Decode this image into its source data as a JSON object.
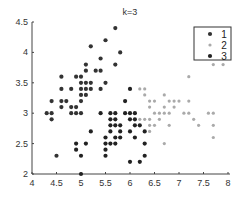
{
  "chart_data": {
    "type": "scatter",
    "title": "k=3",
    "xlabel": "",
    "ylabel": "",
    "xlim": [
      4,
      8
    ],
    "ylim": [
      2,
      4.5
    ],
    "xticks": [
      "4",
      "4.5",
      "5",
      "5.5",
      "6",
      "6.5",
      "7",
      "7.5",
      "8"
    ],
    "yticks": [
      "2",
      "2.5",
      "3",
      "3.5",
      "4",
      "4.5"
    ],
    "grid": false,
    "legend_position": "upper right",
    "series": [
      {
        "name": "1",
        "color": "#333333",
        "points": [
          [
            4.3,
            3.0
          ],
          [
            4.4,
            2.9
          ],
          [
            4.4,
            3.0
          ],
          [
            4.4,
            3.2
          ],
          [
            4.5,
            2.3
          ],
          [
            4.6,
            3.1
          ],
          [
            4.6,
            3.2
          ],
          [
            4.6,
            3.4
          ],
          [
            4.6,
            3.6
          ],
          [
            4.7,
            3.2
          ],
          [
            4.8,
            3.0
          ],
          [
            4.8,
            3.1
          ],
          [
            4.8,
            3.4
          ],
          [
            4.9,
            3.0
          ],
          [
            4.9,
            3.1
          ],
          [
            4.9,
            3.6
          ],
          [
            5.0,
            3.0
          ],
          [
            5.0,
            3.2
          ],
          [
            5.0,
            3.3
          ],
          [
            5.0,
            3.4
          ],
          [
            5.0,
            3.5
          ],
          [
            5.0,
            3.6
          ],
          [
            5.1,
            3.3
          ],
          [
            5.1,
            3.4
          ],
          [
            5.1,
            3.5
          ],
          [
            5.1,
            3.7
          ],
          [
            5.1,
            3.8
          ],
          [
            5.2,
            3.4
          ],
          [
            5.2,
            3.5
          ],
          [
            5.2,
            4.1
          ],
          [
            5.3,
            3.7
          ],
          [
            5.4,
            3.4
          ],
          [
            5.4,
            3.7
          ],
          [
            5.4,
            3.9
          ],
          [
            5.5,
            3.5
          ],
          [
            5.5,
            4.2
          ],
          [
            5.7,
            3.8
          ],
          [
            5.7,
            4.4
          ],
          [
            5.8,
            4.0
          ]
        ]
      },
      {
        "name": "2",
        "color": "#aaaaaa",
        "points": [
          [
            6.2,
            3.4
          ],
          [
            6.3,
            3.3
          ],
          [
            6.3,
            3.4
          ],
          [
            6.4,
            3.1
          ],
          [
            6.4,
            3.2
          ],
          [
            6.5,
            3.0
          ],
          [
            6.5,
            3.2
          ],
          [
            6.6,
            3.0
          ],
          [
            6.7,
            3.0
          ],
          [
            6.7,
            3.1
          ],
          [
            6.7,
            3.3
          ],
          [
            6.8,
            3.0
          ],
          [
            6.8,
            3.2
          ],
          [
            6.9,
            3.1
          ],
          [
            6.9,
            3.2
          ],
          [
            7.0,
            3.2
          ],
          [
            7.1,
            3.0
          ],
          [
            7.2,
            3.0
          ],
          [
            7.2,
            3.2
          ],
          [
            7.2,
            3.6
          ],
          [
            7.3,
            2.9
          ],
          [
            7.4,
            2.8
          ],
          [
            7.6,
            3.0
          ],
          [
            7.7,
            2.6
          ],
          [
            7.7,
            2.8
          ],
          [
            7.7,
            3.0
          ],
          [
            7.7,
            3.8
          ],
          [
            7.9,
            3.8
          ],
          [
            6.4,
            2.8
          ],
          [
            6.4,
            2.9
          ],
          [
            6.5,
            2.8
          ],
          [
            6.6,
            2.9
          ],
          [
            6.7,
            2.5
          ],
          [
            6.8,
            2.8
          ],
          [
            6.3,
            2.9
          ],
          [
            6.4,
            2.7
          ],
          [
            6.2,
            2.9
          ]
        ]
      },
      {
        "name": "3",
        "color": "#222222",
        "points": [
          [
            4.9,
            2.4
          ],
          [
            4.9,
            2.5
          ],
          [
            5.0,
            2.0
          ],
          [
            5.0,
            2.3
          ],
          [
            5.1,
            2.5
          ],
          [
            5.2,
            2.7
          ],
          [
            5.4,
            3.0
          ],
          [
            5.5,
            2.3
          ],
          [
            5.5,
            2.4
          ],
          [
            5.5,
            2.5
          ],
          [
            5.5,
            2.6
          ],
          [
            5.6,
            2.5
          ],
          [
            5.6,
            2.7
          ],
          [
            5.6,
            2.8
          ],
          [
            5.6,
            2.9
          ],
          [
            5.6,
            3.0
          ],
          [
            5.7,
            2.5
          ],
          [
            5.7,
            2.6
          ],
          [
            5.7,
            2.8
          ],
          [
            5.7,
            2.9
          ],
          [
            5.7,
            3.0
          ],
          [
            5.8,
            2.6
          ],
          [
            5.8,
            2.7
          ],
          [
            5.8,
            2.8
          ],
          [
            5.9,
            3.0
          ],
          [
            5.9,
            3.2
          ],
          [
            6.0,
            2.2
          ],
          [
            6.0,
            2.7
          ],
          [
            6.0,
            2.9
          ],
          [
            6.0,
            3.0
          ],
          [
            6.0,
            3.4
          ],
          [
            6.1,
            2.6
          ],
          [
            6.1,
            2.8
          ],
          [
            6.1,
            2.9
          ],
          [
            6.1,
            3.0
          ],
          [
            6.2,
            2.2
          ],
          [
            6.2,
            2.8
          ],
          [
            6.3,
            2.3
          ],
          [
            6.3,
            2.5
          ],
          [
            6.3,
            2.7
          ]
        ]
      }
    ]
  },
  "legend": {
    "items": [
      {
        "label": "1",
        "color": "#333333"
      },
      {
        "label": "2",
        "color": "#aaaaaa"
      },
      {
        "label": "3",
        "color": "#222222"
      }
    ]
  }
}
